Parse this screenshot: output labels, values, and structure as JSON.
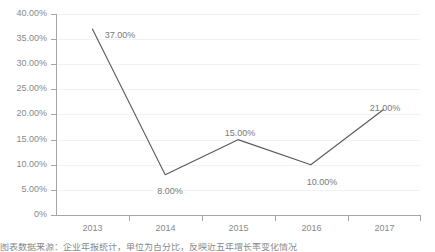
{
  "chart_data": {
    "type": "line",
    "title": "",
    "subtitle": "",
    "xlabel": "",
    "ylabel": "",
    "categories": [
      "2013",
      "2014",
      "2015",
      "2016",
      "2017"
    ],
    "values": [
      37.0,
      8.0,
      15.0,
      10.0,
      21.0
    ],
    "data_labels": [
      "37.00%",
      "8.00%",
      "15.00%",
      "10.00%",
      "21.00%"
    ],
    "label_positions": [
      "above",
      "below",
      "above",
      "below",
      "above"
    ],
    "series": [
      {
        "name": "",
        "values": [
          37.0,
          8.0,
          15.0,
          10.0,
          21.0
        ],
        "color": "#595959"
      }
    ],
    "ylim": [
      0,
      40
    ],
    "ytick_values": [
      40,
      35,
      30,
      25,
      20,
      15,
      10,
      5,
      0
    ],
    "ytick_labels": [
      "40.00%",
      "35.00%",
      "30.00%",
      "25.00%",
      "20.00%",
      "15.00%",
      "10.00%",
      "5.00%",
      "0%"
    ],
    "grid": true,
    "grid_axis": "y",
    "legend": false,
    "legend_position": "none",
    "markers": false,
    "annotations": []
  },
  "style": {
    "line_color": "#595959",
    "grid_color": "#f2f2f2",
    "axis_color": "#a6a6a6",
    "text_color": "#898989",
    "label_color": "#7a7a7a",
    "background": "#ffffff"
  },
  "caption": {
    "text": "图表数据来源：企业年报统计，单位为百分比，反映近五年增长率变化情况"
  }
}
